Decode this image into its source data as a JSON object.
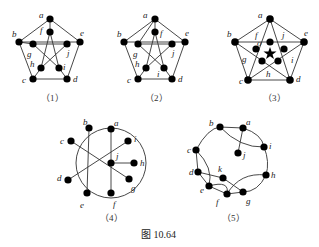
{
  "figure_caption": "图 10.64",
  "graphs": [
    {
      "caption": "（1）",
      "labels": {
        "a": "a",
        "b": "b",
        "c": "c",
        "d": "d",
        "e": "e",
        "f": "f",
        "g": "g",
        "h": "h",
        "i": "i",
        "j": "j"
      }
    },
    {
      "caption": "（2）",
      "labels": {
        "a": "a",
        "b": "b",
        "c": "c",
        "d": "d",
        "e": "e",
        "f": "f",
        "g": "g",
        "h": "h",
        "i": "i",
        "j": "j"
      }
    },
    {
      "caption": "（3）",
      "labels": {
        "a": "a",
        "b": "b",
        "c": "c",
        "d": "d",
        "e": "e",
        "f": "f",
        "g": "g",
        "h": "h",
        "i": "i",
        "j": "j",
        "o": "o"
      }
    },
    {
      "caption": "（4）",
      "labels": {
        "a": "a",
        "b": "b",
        "c": "c",
        "d": "d",
        "e": "e",
        "f": "f",
        "g": "g",
        "h": "h",
        "i": "i",
        "j": "j"
      }
    },
    {
      "caption": "（5）",
      "labels": {
        "a": "a",
        "b": "b",
        "c": "c",
        "d": "d",
        "e": "e",
        "f": "f",
        "g": "g",
        "h": "h",
        "i": "i",
        "j": "j",
        "k": "k"
      }
    }
  ]
}
